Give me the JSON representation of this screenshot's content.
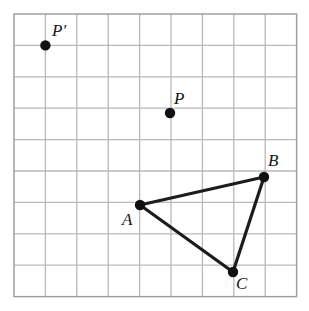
{
  "figure": {
    "type": "geometry-diagram"
  },
  "grid": {
    "columns": 9,
    "rows": 9,
    "left": 14,
    "top": 14,
    "cell_size": 31.4,
    "line_color": "#b9b9b9",
    "border_color": "#9a9a9a",
    "background_color": "#ffffff"
  },
  "style": {
    "segment_color": "#1c1c1c",
    "segment_width": 3.2,
    "dot_color": "#111111",
    "dot_radius": 5.2,
    "label_color": "#161616",
    "label_font_size": 17
  },
  "points": [
    {
      "id": "P-prime",
      "label": "P′",
      "x": 45.4,
      "y": 45.4,
      "grid_col": 1,
      "grid_row": 1,
      "label_x": 52,
      "label_y": 22
    },
    {
      "id": "P",
      "label": "P",
      "x": 170,
      "y": 113,
      "grid_col": 5,
      "grid_row": 3.15,
      "label_x": 174,
      "label_y": 90
    },
    {
      "id": "A",
      "label": "A",
      "x": 140,
      "y": 205,
      "grid_col": 4,
      "grid_row": 6.08,
      "label_x": 122,
      "label_y": 211
    },
    {
      "id": "B",
      "label": "B",
      "x": 264,
      "y": 177,
      "grid_col": 7.96,
      "grid_row": 5.19,
      "label_x": 268,
      "label_y": 152
    },
    {
      "id": "C",
      "label": "C",
      "x": 233,
      "y": 272,
      "grid_col": 6.97,
      "grid_row": 8.21,
      "label_x": 236,
      "label_y": 275
    }
  ],
  "segments": [
    {
      "id": "AB",
      "from": "A",
      "to": "B",
      "x1": 140,
      "y1": 205,
      "x2": 264,
      "y2": 177
    },
    {
      "id": "BC",
      "from": "B",
      "to": "C",
      "x1": 264,
      "y1": 177,
      "x2": 233,
      "y2": 272
    },
    {
      "id": "CA",
      "from": "C",
      "to": "A",
      "x1": 233,
      "y1": 272,
      "x2": 140,
      "y2": 205
    }
  ]
}
